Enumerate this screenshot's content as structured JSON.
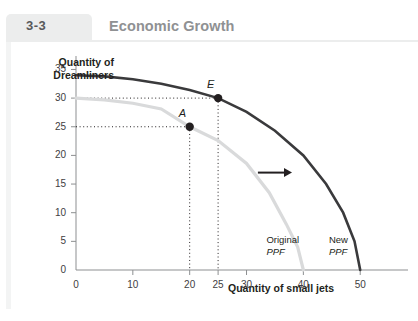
{
  "figure": {
    "rail_label": "FIGURE",
    "number": "3-3",
    "title": "Economic Growth"
  },
  "chart_data": {
    "type": "line",
    "title": "Economic Growth",
    "xlabel": "Quantity of small jets",
    "ylabel": "Quantity of Dreamliners",
    "xlim": [
      0,
      57
    ],
    "ylim": [
      0,
      37
    ],
    "xticks": [
      0,
      10,
      20,
      25,
      30,
      40,
      50
    ],
    "yticks": [
      0,
      5,
      10,
      15,
      20,
      25,
      30,
      35
    ],
    "grid": false,
    "legend": "inline-annotations",
    "series": [
      {
        "name": "Original PPF",
        "color": "#d9dadb",
        "x_intercept": 40,
        "y_intercept": 30,
        "points": [
          [
            0,
            30
          ],
          [
            5,
            29.7
          ],
          [
            10,
            29.1
          ],
          [
            15,
            28.1
          ],
          [
            20,
            25
          ],
          [
            25,
            22.6
          ],
          [
            30,
            18.6
          ],
          [
            34,
            13.5
          ],
          [
            37,
            8
          ],
          [
            39,
            4
          ],
          [
            40,
            0
          ]
        ]
      },
      {
        "name": "New PPF",
        "color": "#3a3a3c",
        "x_intercept": 50,
        "y_intercept": 34,
        "points": [
          [
            0,
            34
          ],
          [
            5,
            33.8
          ],
          [
            10,
            33.3
          ],
          [
            15,
            32.5
          ],
          [
            20,
            31.4
          ],
          [
            25,
            30
          ],
          [
            30,
            27.6
          ],
          [
            35,
            24.3
          ],
          [
            40,
            20
          ],
          [
            44,
            15
          ],
          [
            47,
            10
          ],
          [
            49,
            5
          ],
          [
            50,
            0
          ]
        ]
      }
    ],
    "annotations": [
      {
        "label": "A",
        "x": 20,
        "y": 25,
        "series": "Original PPF",
        "marker": "filled-circle"
      },
      {
        "label": "E",
        "x": 25,
        "y": 30,
        "series": "New PPF",
        "marker": "filled-circle"
      }
    ],
    "curve_labels": [
      {
        "line1": "Original",
        "line2": "PPF"
      },
      {
        "line1": "New",
        "line2": "PPF"
      }
    ],
    "arrow": {
      "from_x": 32,
      "to_x": 38,
      "y": 17,
      "direction": "right"
    }
  }
}
